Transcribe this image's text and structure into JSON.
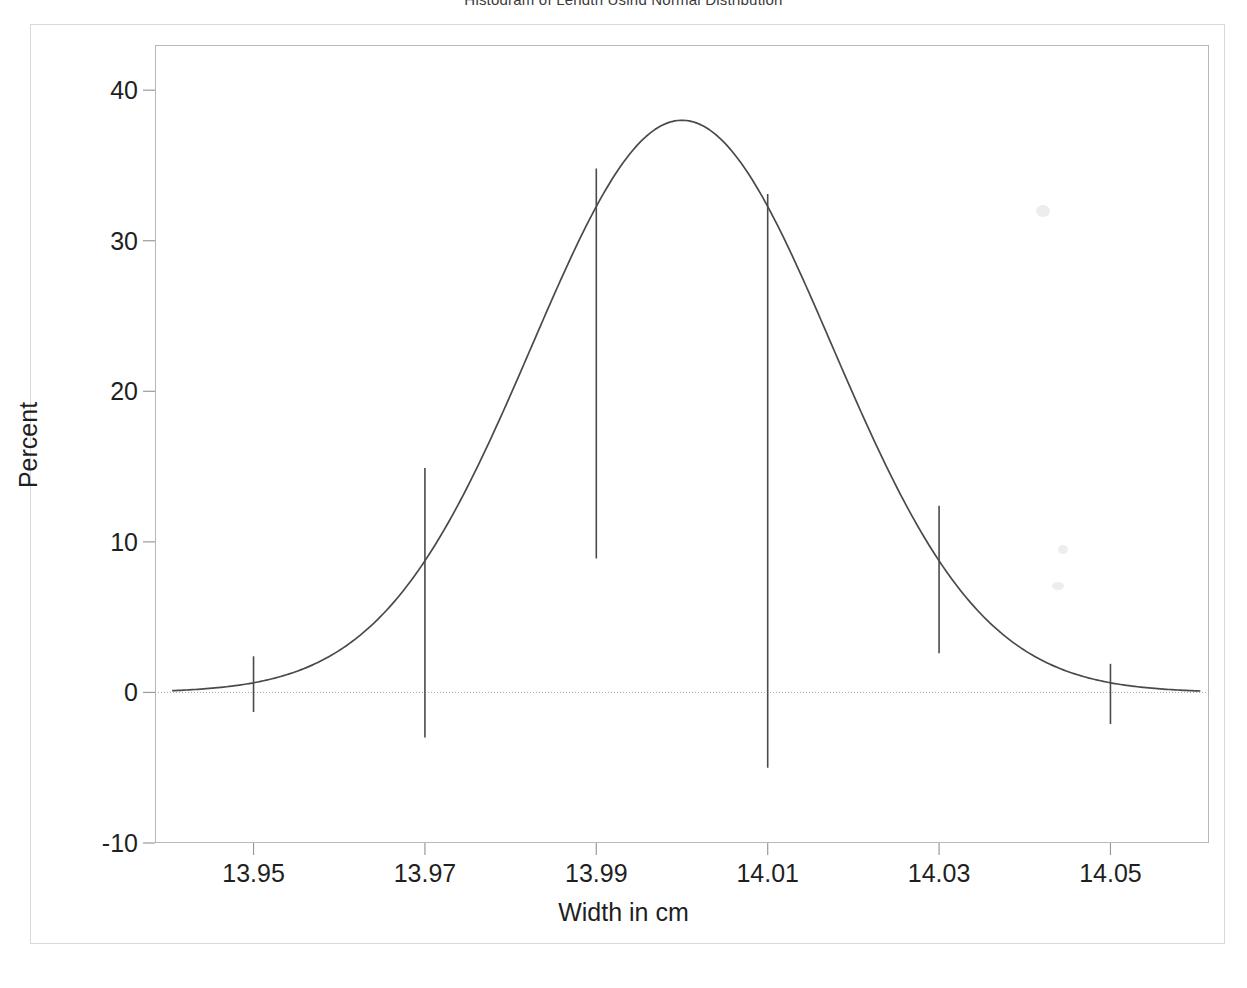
{
  "figure": {
    "title_partial": "Histogram of Length Using Normal Distribution",
    "background_color": "#ffffff",
    "line_color": "#4a4a4a",
    "frame_color": "#b8b8b8"
  },
  "axes": {
    "y_title": "Percent",
    "x_title": "Width in cm",
    "y_ticks": [
      {
        "label": "40",
        "value": 40
      },
      {
        "label": "30",
        "value": 30
      },
      {
        "label": "20",
        "value": 20
      },
      {
        "label": "10",
        "value": 10
      },
      {
        "label": "0",
        "value": 0
      },
      {
        "label": "-10",
        "value": -10
      }
    ],
    "x_ticks": [
      {
        "label": "13.95",
        "value": 13.95
      },
      {
        "label": "13.97",
        "value": 13.97
      },
      {
        "label": "13.99",
        "value": 13.99
      },
      {
        "label": "14.01",
        "value": 14.01
      },
      {
        "label": "14.03",
        "value": 14.03
      },
      {
        "label": "14.05",
        "value": 14.05
      }
    ]
  },
  "chart_data": {
    "type": "line",
    "title": "Histogram of Length Using Normal Distribution",
    "xlabel": "Width in cm",
    "ylabel": "Percent",
    "xlim": [
      13.9385,
      14.0615
    ],
    "ylim": [
      -10,
      43
    ],
    "grid": false,
    "legend": null,
    "series": [
      {
        "name": "Normal density curve",
        "kind": "curve",
        "curve_model": "normal",
        "mean": 14.0,
        "sigma": 0.0175,
        "peak_percent": 38.0,
        "x_start": 13.9405,
        "x_end": 14.0605,
        "points": [
          {
            "x": 13.9405,
            "y": 0.9
          },
          {
            "x": 13.945,
            "y": 1.6
          },
          {
            "x": 13.95,
            "y": 2.4
          },
          {
            "x": 13.955,
            "y": 3.8
          },
          {
            "x": 13.96,
            "y": 5.8
          },
          {
            "x": 13.965,
            "y": 8.6
          },
          {
            "x": 13.97,
            "y": 14.9
          },
          {
            "x": 13.975,
            "y": 18.0
          },
          {
            "x": 13.98,
            "y": 23.5
          },
          {
            "x": 13.985,
            "y": 29.2
          },
          {
            "x": 13.99,
            "y": 34.8
          },
          {
            "x": 13.995,
            "y": 37.4
          },
          {
            "x": 14.0,
            "y": 38.0
          },
          {
            "x": 14.005,
            "y": 37.1
          },
          {
            "x": 14.01,
            "y": 33.1
          },
          {
            "x": 14.015,
            "y": 28.4
          },
          {
            "x": 14.02,
            "y": 22.6
          },
          {
            "x": 14.025,
            "y": 17.2
          },
          {
            "x": 14.03,
            "y": 12.4
          },
          {
            "x": 14.035,
            "y": 8.4
          },
          {
            "x": 14.04,
            "y": 5.5
          },
          {
            "x": 14.045,
            "y": 3.4
          },
          {
            "x": 14.05,
            "y": 1.9
          },
          {
            "x": 14.055,
            "y": 1.1
          },
          {
            "x": 14.0605,
            "y": 0.5
          }
        ]
      },
      {
        "name": "Midpoint needles",
        "kind": "needles",
        "needles": [
          {
            "x": 13.95,
            "top": 2.4,
            "bottom": -1.3
          },
          {
            "x": 13.97,
            "top": 14.9,
            "bottom": -3.0
          },
          {
            "x": 13.99,
            "top": 34.8,
            "bottom": 8.9
          },
          {
            "x": 14.01,
            "top": 33.1,
            "bottom": -5.0
          },
          {
            "x": 14.03,
            "top": 12.4,
            "bottom": 2.6
          },
          {
            "x": 14.05,
            "top": 1.9,
            "bottom": -2.1
          }
        ]
      },
      {
        "name": "Zero reference line",
        "kind": "hline",
        "y": 0
      }
    ]
  }
}
